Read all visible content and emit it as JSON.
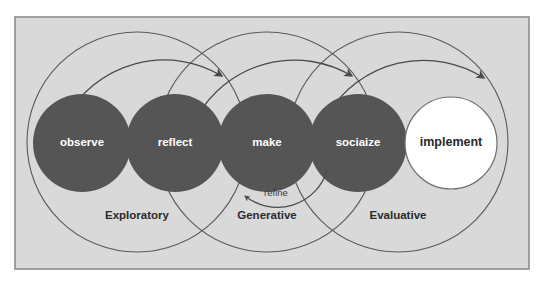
{
  "diagram": {
    "frame": {
      "background_color": "#d9d9d9",
      "border_color": "#8c8c8c",
      "outer_background": "#ffffff"
    },
    "colors": {
      "node_fill_dark": "#555555",
      "node_fill_light": "#ffffff",
      "node_stroke_light": "#6e6e6e",
      "node_text_light": "#ffffff",
      "node_text_dark": "#2a2a2a",
      "arc_stroke": "#4a4a4a",
      "phase_text": "#2b2b2b",
      "edge_text": "#3a3a3a"
    },
    "nodes": [
      {
        "id": "observe",
        "label": "observe",
        "style": "filled",
        "cx": 82,
        "cy": 143,
        "r": 49
      },
      {
        "id": "reflect",
        "label": "reflect",
        "style": "filled",
        "cx": 175,
        "cy": 143,
        "r": 49
      },
      {
        "id": "make",
        "label": "make",
        "style": "filled",
        "cx": 267,
        "cy": 143,
        "r": 49
      },
      {
        "id": "socialize",
        "label": "sociaize",
        "style": "filled",
        "cx": 358,
        "cy": 143,
        "r": 49
      },
      {
        "id": "implement",
        "label": "implement",
        "style": "outline",
        "cx": 451,
        "cy": 143,
        "r": 46
      }
    ],
    "phases": [
      {
        "id": "exploratory",
        "label": "Exploratory",
        "cx": 137,
        "cy": 142,
        "r": 110,
        "label_x": 137,
        "label_y": 216
      },
      {
        "id": "generative",
        "label": "Generative",
        "cx": 267,
        "cy": 142,
        "r": 110,
        "label_x": 267,
        "label_y": 216
      },
      {
        "id": "evaluative",
        "label": "Evaluative",
        "cx": 398,
        "cy": 142,
        "r": 110,
        "label_x": 398,
        "label_y": 216
      }
    ],
    "flow_arrows": [
      {
        "id": "arrow-observe-to-make",
        "from": "observe",
        "to": "make",
        "direction": "forward"
      },
      {
        "id": "arrow-reflect-to-socialize",
        "from": "reflect",
        "to": "socialize",
        "direction": "forward"
      },
      {
        "id": "arrow-make-to-implement",
        "from": "make",
        "to": "implement",
        "direction": "forward"
      }
    ],
    "feedback_arrows": [
      {
        "id": "arrow-refine",
        "label": "refine",
        "from": "socialize",
        "to": "make",
        "direction": "backward",
        "label_x": 276,
        "label_y": 194
      }
    ]
  }
}
